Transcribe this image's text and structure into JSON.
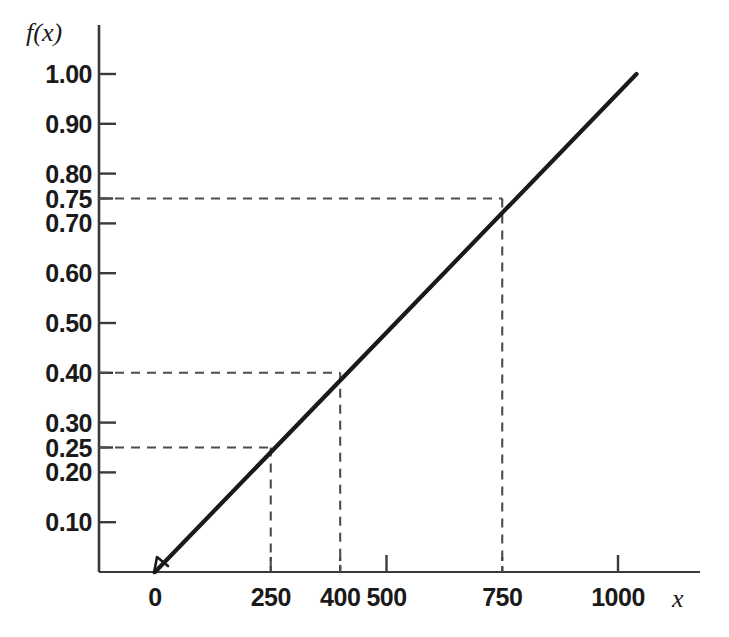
{
  "chart_data": {
    "type": "line",
    "title": "",
    "subtitle": "",
    "xlabel": "x",
    "ylabel": "f(x)",
    "xlim": [
      0,
      1080
    ],
    "ylim": [
      0,
      1.04
    ],
    "grid": false,
    "legend": null,
    "x_ticks": [
      {
        "value": 0,
        "label": "0",
        "style": "solid"
      },
      {
        "value": 250,
        "label": "250",
        "style": "dashed"
      },
      {
        "value": 400,
        "label": "400",
        "style": "dashed"
      },
      {
        "value": 500,
        "label": "500",
        "style": "solid"
      },
      {
        "value": 750,
        "label": "750",
        "style": "dashed"
      },
      {
        "value": 1000,
        "label": "1000",
        "style": "solid"
      }
    ],
    "y_ticks": [
      {
        "value": 1.0,
        "label": "1.00",
        "style": "solid"
      },
      {
        "value": 0.9,
        "label": "0.90",
        "style": "solid"
      },
      {
        "value": 0.8,
        "label": "0.80",
        "style": "solid"
      },
      {
        "value": 0.75,
        "label": "0.75",
        "style": "dashed"
      },
      {
        "value": 0.7,
        "label": "0.70",
        "style": "solid"
      },
      {
        "value": 0.6,
        "label": "0.60",
        "style": "solid"
      },
      {
        "value": 0.5,
        "label": "0.50",
        "style": "solid"
      },
      {
        "value": 0.4,
        "label": "0.40",
        "style": "dashed"
      },
      {
        "value": 0.3,
        "label": "0.30",
        "style": "solid"
      },
      {
        "value": 0.25,
        "label": "0.25",
        "style": "dashed"
      },
      {
        "value": 0.2,
        "label": "0.20",
        "style": "solid"
      },
      {
        "value": 0.1,
        "label": "0.10",
        "style": "solid"
      }
    ],
    "series": [
      {
        "name": "f(x)",
        "kind": "line",
        "color": "#1a1a1a",
        "x": [
          0,
          1040
        ],
        "values": [
          0.0,
          1.0
        ],
        "description": "straight line from origin rising linearly"
      }
    ],
    "reference_points": [
      {
        "x": 250,
        "y": 0.25
      },
      {
        "x": 400,
        "y": 0.4
      },
      {
        "x": 750,
        "y": 0.75
      }
    ],
    "annotations": []
  },
  "axis_labels": {
    "y": "f(x)",
    "x": "x"
  },
  "colors": {
    "background": "#ffffff",
    "axis": "#3a3a3a",
    "curve": "#1a1a1a",
    "dashed": "#4d4d4d",
    "text": "#1a1a1a"
  }
}
